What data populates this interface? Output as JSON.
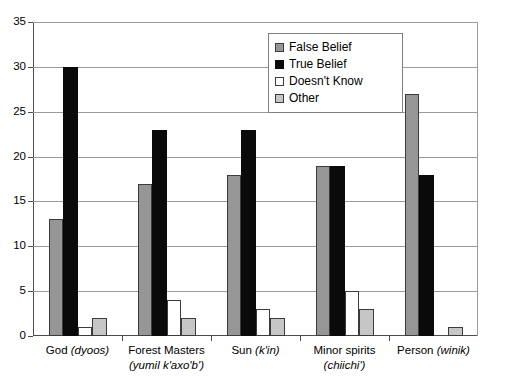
{
  "chart_data": {
    "type": "bar",
    "title": "",
    "subtitle": "",
    "xlabel": "",
    "ylabel": "",
    "ylim": [
      0,
      35
    ],
    "ytick_step": 5,
    "yticks": [
      0,
      5,
      10,
      15,
      20,
      25,
      30,
      35
    ],
    "grid": true,
    "grid_axis": "y",
    "legend_position": "upper center-right",
    "legend_entries": [
      "False Belief",
      "True Belief",
      "Doesn't Know",
      "Other"
    ],
    "categories": [
      "God (dyoos)",
      "Forest Masters (yumil k'axo'b')",
      "Sun (k'in)",
      "Minor spirits (chiichi')",
      "Person (winik)"
    ],
    "category_parts": [
      {
        "line1_plain": "God ",
        "line1_italic": "(dyoos)",
        "line2_plain": "",
        "line2_italic": ""
      },
      {
        "line1_plain": "Forest Masters",
        "line1_italic": "",
        "line2_plain": "",
        "line2_italic": "(yumil k'axo'b')"
      },
      {
        "line1_plain": "Sun ",
        "line1_italic": "(k'in)",
        "line2_plain": "",
        "line2_italic": ""
      },
      {
        "line1_plain": "Minor spirits",
        "line1_italic": "",
        "line2_plain": "",
        "line2_italic": "(chiichi')"
      },
      {
        "line1_plain": "Person ",
        "line1_italic": "(winik)",
        "line2_plain": "",
        "line2_italic": ""
      }
    ],
    "series": [
      {
        "name": "False Belief",
        "color": "#969696",
        "values": [
          13,
          17,
          18,
          19,
          27
        ]
      },
      {
        "name": "True Belief",
        "color": "#0a0a0a",
        "values": [
          30,
          23,
          23,
          19,
          18
        ]
      },
      {
        "name": "Doesn't Know",
        "color": "#ffffff",
        "values": [
          1,
          4,
          3,
          5,
          0
        ]
      },
      {
        "name": "Other",
        "color": "#c6c6c6",
        "values": [
          2,
          2,
          2,
          3,
          1
        ]
      }
    ]
  },
  "axis": {
    "tick_labels": [
      "35",
      "30",
      "25",
      "20",
      "15",
      "10",
      "5",
      "0"
    ]
  },
  "legend": {
    "items": [
      {
        "label": "False Belief",
        "swatch": "series-0-swatch"
      },
      {
        "label": "True Belief",
        "swatch": "series-1-swatch"
      },
      {
        "label": "Doesn't Know",
        "swatch": "series-2-swatch"
      },
      {
        "label": "Other",
        "swatch": "series-3-swatch"
      }
    ]
  },
  "colors": {
    "false_belief": "#969696",
    "true_belief": "#0a0a0a",
    "doesnt_know": "#ffffff",
    "other": "#c6c6c6",
    "axis": "#4d4d4d",
    "grid": "#9a9a9a",
    "background": "#ffffff"
  }
}
